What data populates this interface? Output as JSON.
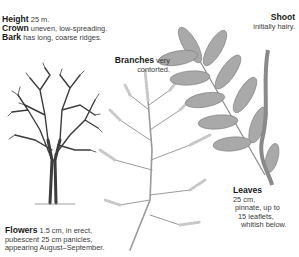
{
  "captions": {
    "height": {
      "term": "Height",
      "text": " 25 m."
    },
    "crown": {
      "term": "Crown",
      "text": " uneven, low-spreading."
    },
    "bark": {
      "term": "Bark",
      "text": " has long, coarse ridges."
    },
    "branches": {
      "term": "Branches",
      "text": " very",
      "line2": "contorted."
    },
    "shoot": {
      "term": "Shoot",
      "line2": "initially hairy."
    },
    "leaves": {
      "term": "Leaves",
      "line1": "25 cm,",
      "line2": "pinnate, up to",
      "line3": "15 leaflets,",
      "line4": "whitish below."
    },
    "flowers": {
      "term": "Flowers",
      "text": " 1.5 cm, in erect,",
      "line2": "pubescent 25 cm panicles,",
      "line3": "appearing August–September."
    }
  },
  "illustrations": [
    "tree-silhouette",
    "flower-panicle",
    "pinnate-leaf-with-shoot"
  ]
}
